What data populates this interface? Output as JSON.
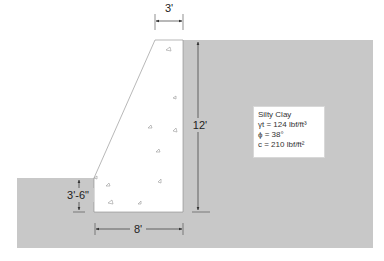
{
  "diagram": {
    "type": "retaining-wall-cross-section",
    "colors": {
      "soil": "#c8c8c8",
      "wall": "#ffffff",
      "lines": "#333333"
    },
    "dimensions": {
      "top_width": "3'",
      "height": "12'",
      "base_width": "8'",
      "embedment": "3'-6\""
    },
    "soil_properties": {
      "name": "Silty Clay",
      "unit_weight": "γt = 124 lbf/ft³",
      "friction_angle": "ϕ = 38°",
      "cohesion": "c = 210 lbf/ft²"
    }
  }
}
